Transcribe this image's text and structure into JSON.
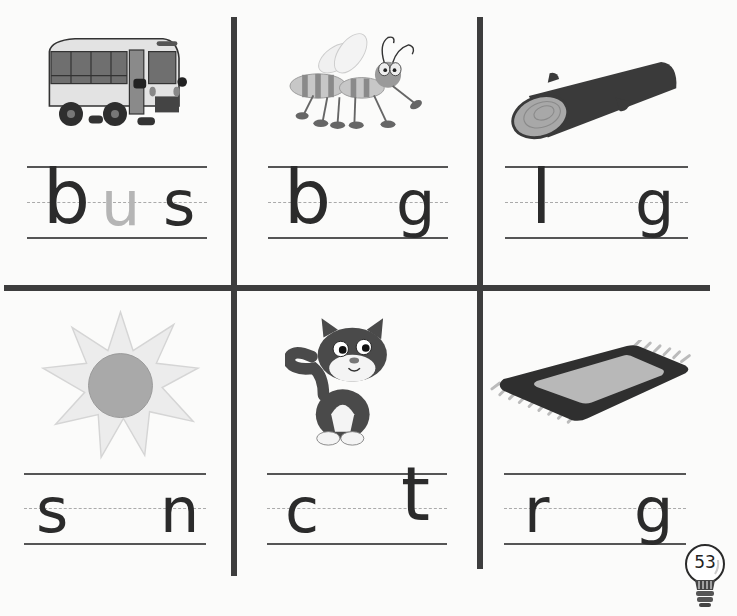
{
  "worksheet": {
    "instruction": "Write the missing vowel",
    "page_number": "53",
    "cells": [
      {
        "picture": "bus",
        "icon": "bus-icon",
        "letters": [
          "b",
          "u",
          "s"
        ],
        "traced_letter": "u"
      },
      {
        "picture": "bug",
        "icon": "bug-icon",
        "letters": [
          "b",
          "",
          "g"
        ]
      },
      {
        "picture": "log",
        "icon": "log-icon",
        "letters": [
          "l",
          "",
          "g"
        ]
      },
      {
        "picture": "sun",
        "icon": "sun-icon",
        "letters": [
          "s",
          "",
          "n"
        ]
      },
      {
        "picture": "cat",
        "icon": "cat-icon",
        "letters": [
          "c",
          "",
          "t"
        ]
      },
      {
        "picture": "rug",
        "icon": "rug-icon",
        "letters": [
          "r",
          "",
          "g"
        ]
      }
    ]
  },
  "colors": {
    "ink": "#2b2b2b",
    "divider": "#3d3d3d",
    "trace": "#b5b5b5",
    "paper": "#fbfbfa"
  }
}
